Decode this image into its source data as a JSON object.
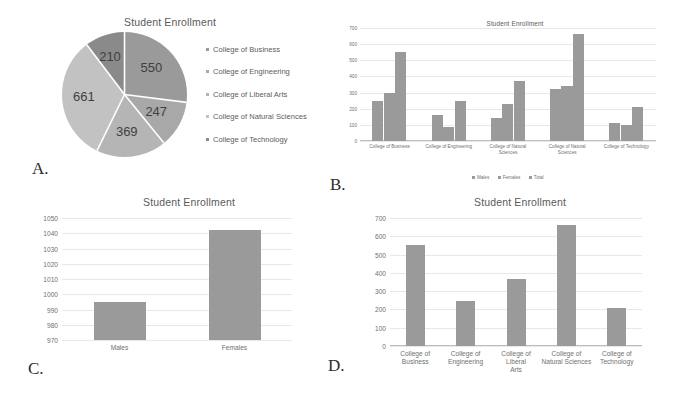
{
  "panels": {
    "a": {
      "letter": "A."
    },
    "b": {
      "letter": "B."
    },
    "c": {
      "letter": "C."
    },
    "d": {
      "letter": "D."
    }
  },
  "colors": {
    "slice_business": "#9a9a9a",
    "slice_engineering": "#a8a8a8",
    "slice_liberal_arts": "#b5b5b5",
    "slice_natural_sciences": "#c2c2c2",
    "slice_technology": "#8a8a8a",
    "bar": "#9a9a9a",
    "grid": "#e8e8e8",
    "text": "#707070"
  },
  "chart_data": [
    {
      "id": "pie-enrollment",
      "type": "pie",
      "title": "Student Enrollment",
      "categories": [
        "College of Business",
        "College of Engineering",
        "College of Liberal Arts",
        "College of Natural Sciences",
        "College of Technology"
      ],
      "values": [
        550,
        247,
        369,
        661,
        210
      ],
      "labels": [
        "550",
        "247",
        "369",
        "661",
        "210"
      ],
      "legend_position": "right",
      "grid": false
    },
    {
      "id": "grouped-bar-enrollment",
      "type": "bar",
      "title": "Student Enrollment",
      "categories": [
        "College of Business",
        "College of Engineering",
        "College of Liberal Arts",
        "College of Natural Sciences",
        "College of Technology"
      ],
      "series": [
        {
          "name": "Males",
          "values": [
            250,
            159,
            141,
            320,
            110
          ]
        },
        {
          "name": "Females",
          "values": [
            300,
            88,
            228,
            341,
            100
          ]
        },
        {
          "name": "Total",
          "values": [
            550,
            247,
            369,
            661,
            210
          ]
        }
      ],
      "xlabel": "",
      "ylabel": "",
      "ylim": [
        0,
        700
      ],
      "yticks": [
        0,
        100,
        200,
        300,
        400,
        500,
        600,
        700
      ],
      "legend_position": "bottom",
      "grid": true
    },
    {
      "id": "gender-bar-enrollment",
      "type": "bar",
      "title": "Student Enrollment",
      "categories": [
        "Males",
        "Females"
      ],
      "values": [
        995,
        1042
      ],
      "xlabel": "",
      "ylabel": "",
      "ylim": [
        970,
        1050
      ],
      "yticks": [
        970,
        980,
        990,
        1000,
        1010,
        1020,
        1030,
        1040,
        1050
      ],
      "grid": true
    },
    {
      "id": "college-bar-enrollment",
      "type": "bar",
      "title": "Student Enrollment",
      "categories": [
        "College of Business",
        "College of Engineering",
        "College of Liberal Arts",
        "College of Natural Sciences",
        "College of Technology"
      ],
      "category_lines": [
        [
          "College of",
          "Business"
        ],
        [
          "College of",
          "Engineering"
        ],
        [
          "College of Liberal",
          "Arts"
        ],
        [
          "College of",
          "Natural Sciences"
        ],
        [
          "College of",
          "Technology"
        ]
      ],
      "values": [
        550,
        247,
        369,
        661,
        210
      ],
      "xlabel": "",
      "ylabel": "",
      "ylim": [
        0,
        700
      ],
      "yticks": [
        0,
        100,
        200,
        300,
        400,
        500,
        600,
        700
      ],
      "grid": true
    }
  ]
}
